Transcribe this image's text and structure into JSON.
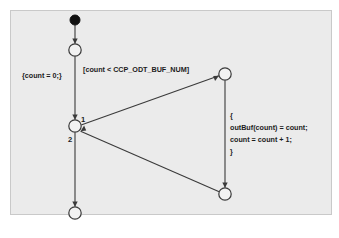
{
  "diagram": {
    "type": "uml-activity-diagram",
    "canvas": {
      "width": 339,
      "height": 238,
      "page_background": "#ffffff",
      "frame_background": "#ebebeb",
      "frame_border": "#c9c9c9",
      "line_color": "#3a3a3a"
    },
    "nodes": [
      {
        "id": "initial",
        "name": "initial-node",
        "shape": "filled-circle",
        "cx": 75,
        "cy": 20,
        "r": 5.0
      },
      {
        "id": "state_a",
        "name": "state-node-a",
        "shape": "circle",
        "cx": 75,
        "cy": 50,
        "r": 6.2
      },
      {
        "id": "branch",
        "name": "branch-node",
        "shape": "circle",
        "cx": 75,
        "cy": 126,
        "r": 6.2
      },
      {
        "id": "state_top_r",
        "name": "state-node-top-right",
        "shape": "circle",
        "cx": 225,
        "cy": 74,
        "r": 6.2
      },
      {
        "id": "state_bot_r",
        "name": "state-node-bottom-right",
        "shape": "circle",
        "cx": 225,
        "cy": 194,
        "r": 6.2
      },
      {
        "id": "state_end",
        "name": "state-node-end",
        "shape": "circle",
        "cx": 75,
        "cy": 213,
        "r": 6.2
      }
    ],
    "edges": [
      {
        "id": "e_init_a",
        "name": "edge-initial-to-state-a",
        "from": "initial",
        "to": "state_a"
      },
      {
        "id": "e_a_branch",
        "name": "edge-state-a-to-branch",
        "from": "state_a",
        "to": "branch"
      },
      {
        "id": "e_topr_br",
        "name": "edge-top-right-to-branch",
        "from": "state_top_r",
        "to": "branch"
      },
      {
        "id": "e_br_topr",
        "name": "edge-branch-to-top-right",
        "from": "branch",
        "to": "state_top_r"
      },
      {
        "id": "e_topr_botr",
        "name": "edge-top-right-to-bottom-right",
        "from": "state_top_r",
        "to": "state_bot_r"
      },
      {
        "id": "e_botr_br",
        "name": "edge-bottom-right-to-branch",
        "from": "state_bot_r",
        "to": "branch"
      },
      {
        "id": "e_br_end",
        "name": "edge-branch-to-end",
        "from": "branch",
        "to": "state_end"
      }
    ],
    "branch_labels": {
      "first": "1",
      "second": "2"
    },
    "labels": {
      "init_action": "{count = 0;}",
      "guard": "[count < CCP_ODT_BUF_NUM]"
    },
    "action_block": {
      "lines": [
        "{",
        "outBuf(count) = count;",
        "count = count + 1;",
        "}"
      ]
    }
  }
}
